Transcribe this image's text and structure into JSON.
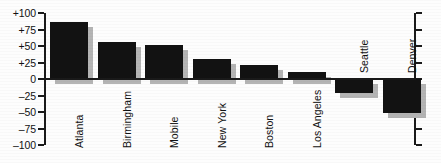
{
  "chart_data": {
    "type": "bar",
    "title": "",
    "subtitle": "",
    "xlabel": "",
    "ylabel": "",
    "categories": [
      "Atlanta",
      "Birmingham",
      "Mobile",
      "New York",
      "Boston",
      "Los Angeles",
      "Seattle",
      "Denver"
    ],
    "values": [
      86,
      56,
      51,
      31,
      21,
      10,
      -21,
      -52
    ],
    "ylim": [
      -100,
      100
    ],
    "ytick_values": [
      100,
      75,
      50,
      25,
      0,
      -25,
      -50,
      -75,
      -100
    ],
    "ytick_labels": [
      "+100",
      "+75",
      "+50",
      "+25",
      "0",
      "–25",
      "–50",
      "–75",
      "–100"
    ],
    "grid": false,
    "legend": null,
    "bar_color": "#121212",
    "shadow_color": "#b4b4b4",
    "axis_color": "#1a1a1a",
    "background_color": "#fdfdfd",
    "label_rotation": -90
  }
}
